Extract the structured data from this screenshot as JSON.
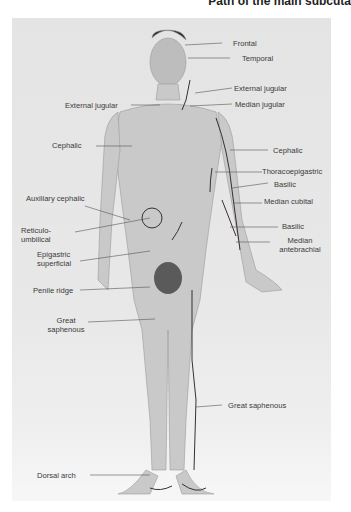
{
  "title": "Path of the main subcuta",
  "labels": {
    "frontal": "Frontal",
    "temporal": "Temporal",
    "external_jugular_r": "External jugular",
    "median_jugular": "Median jugular",
    "external_jugular_l": "External jugular",
    "cephalic_l": "Cephalic",
    "cephalic_r": "Cephalic",
    "thoracoepigastric": "Thoracoepigastric",
    "basilic_1": "Basilic",
    "median_cubital": "Median cubital",
    "basilic_2": "Basilic",
    "median_antebrachial_1": "Median",
    "median_antebrachial_2": "antebrachial",
    "auxiliary_cephalic": "Auxiliary cephalic",
    "reticulo_1": "Reticulo-",
    "reticulo_2": "umbilical",
    "epigastric_1": "Epigastric",
    "epigastric_2": "superficial",
    "penile_ridge": "Penile ridge",
    "great_saphenous_l1": "Great",
    "great_saphenous_l2": "saphenous",
    "great_saphenous_r": "Great saphenous",
    "dorsal_arch": "Dorsal arch"
  },
  "colors": {
    "leader_line": "#555555",
    "vein": "#3a3030",
    "background": "#e6e6e6"
  }
}
